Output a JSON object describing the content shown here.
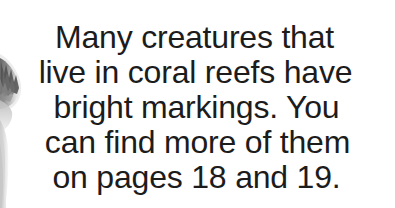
{
  "page": {
    "background_color": "#ffffff",
    "text_color": "#1c1c1c"
  },
  "caption": {
    "lines": [
      "Many creatures that",
      "live in coral reefs have",
      "bright markings. You",
      "can find more of them",
      "on pages 18 and 19."
    ],
    "full_text": "Many creatures that live in coral reefs have bright markings. You can find more of them on pages 18 and 19.",
    "page_references": [
      18,
      19
    ]
  },
  "illustration": {
    "name": "fish-fin-illustration",
    "description": "grayscale fin fragment",
    "colors": {
      "dark": "#5a5a5a",
      "mid": "#9a9a9a",
      "light": "#d8d8d8",
      "pale": "#ececec"
    }
  }
}
